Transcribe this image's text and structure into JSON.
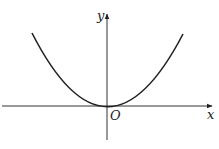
{
  "diagram": {
    "type": "function-graph",
    "function": "y = a x^2 (a > 0)",
    "axes": {
      "x_label": "x",
      "y_label": "y",
      "origin_label": "O"
    },
    "colors": {
      "stroke": "#222222",
      "background": "#ffffff"
    }
  }
}
